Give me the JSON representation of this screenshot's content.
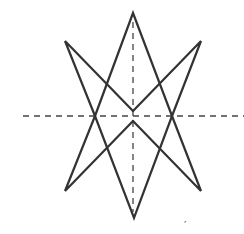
{
  "diagram": {
    "type": "symmetric star figure with axes of symmetry",
    "stroke_color": "#333333",
    "axis_color": "#444444",
    "vertices": {
      "top_apex": [
        133,
        13
      ],
      "upper_left": [
        65,
        41
      ],
      "upper_right": [
        201,
        41
      ],
      "left_mid": [
        95,
        116
      ],
      "right_mid": [
        172,
        116
      ],
      "upper_notch": [
        133,
        111
      ],
      "lower_notch": [
        133,
        121
      ],
      "lower_left": [
        65,
        191
      ],
      "lower_right": [
        201,
        191
      ],
      "bottom_apex": [
        134,
        218
      ]
    },
    "symmetry_axes": {
      "horizontal": {
        "y": 116,
        "x1": 23,
        "x2": 244
      },
      "vertical": {
        "x": 133,
        "y1": 22,
        "y2": 212
      }
    },
    "annotation_mark": "′"
  }
}
